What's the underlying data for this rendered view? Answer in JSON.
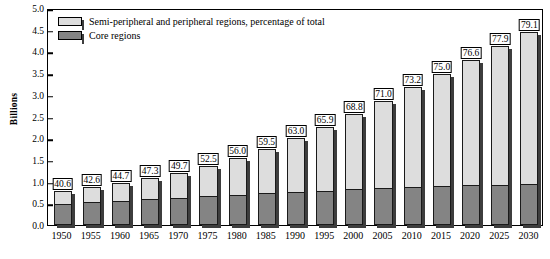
{
  "chart_data": {
    "type": "bar",
    "stacked": true,
    "title": "",
    "subtitle": "",
    "xlabel": "",
    "ylabel": "Billions",
    "ylim": [
      0.0,
      5.0
    ],
    "ytick_labels": [
      "0.0",
      "0.5",
      "1.0",
      "1.5",
      "2.0",
      "2.5",
      "3.0",
      "3.5",
      "4.0",
      "4.5",
      "5.0"
    ],
    "ytick_values": [
      0.0,
      0.5,
      1.0,
      1.5,
      2.0,
      2.5,
      3.0,
      3.5,
      4.0,
      4.5,
      5.0
    ],
    "grid": false,
    "legend_position": "top-left",
    "categories": [
      "1950",
      "1955",
      "1960",
      "1965",
      "1970",
      "1975",
      "1980",
      "1985",
      "1990",
      "1995",
      "2000",
      "2005",
      "2010",
      "2015",
      "2020",
      "2025",
      "2030"
    ],
    "series": [
      {
        "name": "Core regions",
        "color": "#848484",
        "values": [
          0.47,
          0.5,
          0.53,
          0.57,
          0.61,
          0.64,
          0.68,
          0.71,
          0.74,
          0.77,
          0.8,
          0.83,
          0.85,
          0.87,
          0.89,
          0.91,
          0.93
        ]
      },
      {
        "name": "Semi-peripheral and peripheral regions,  percentage of total",
        "color": "#dddddd",
        "values": [
          0.32,
          0.37,
          0.43,
          0.51,
          0.6,
          0.71,
          0.87,
          1.04,
          1.26,
          1.49,
          1.76,
          2.03,
          2.32,
          2.61,
          2.91,
          3.21,
          3.52
        ]
      }
    ],
    "totals": [
      0.79,
      0.87,
      0.96,
      1.08,
      1.21,
      1.35,
      1.55,
      1.75,
      2.0,
      2.26,
      2.56,
      2.86,
      3.17,
      3.48,
      3.8,
      4.12,
      4.45
    ],
    "bar_value_labels": [
      "40.6",
      "42.6",
      "44.7",
      "47.3",
      "49.7",
      "52.5",
      "56.0",
      "59.5",
      "63.0",
      "65.9",
      "68.8",
      "71.0",
      "73.2",
      "75.0",
      "76.6",
      "77.9",
      "79.1"
    ],
    "bar_value_label_note": "percentage of total that is semi-peripheral and peripheral"
  },
  "legend": {
    "items": [
      {
        "label": "Semi-peripheral and peripheral regions,  percentage of total",
        "color": "#dddddd"
      },
      {
        "label": "Core regions",
        "color": "#848484"
      }
    ]
  },
  "axes": {
    "y_title": "Billions"
  },
  "colors": {
    "light_gray": "#dddddd",
    "dark_gray": "#848484",
    "shadow": "#3d3d3d",
    "outline": "#000000",
    "background": "#ffffff"
  }
}
